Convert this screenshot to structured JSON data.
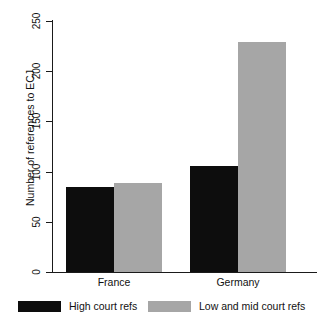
{
  "chart_data": {
    "type": "bar",
    "title": "",
    "xlabel": "",
    "ylabel": "Number of references to ECJ",
    "categories": [
      "France",
      "Germany"
    ],
    "series": [
      {
        "name": "High court refs",
        "color": "#0d0d0d",
        "values": [
          85,
          106
        ]
      },
      {
        "name": "Low and mid court refs",
        "color": "#a6a6a6",
        "values": [
          89,
          229
        ]
      }
    ],
    "ylim": [
      0,
      250
    ],
    "yticks": [
      0,
      50,
      100,
      150,
      200,
      250
    ],
    "ytick_labels": [
      "0",
      "50",
      "100",
      "150",
      "200",
      "250"
    ],
    "grid": false,
    "legend_position": "bottom"
  },
  "axis": {
    "y_title": "Number of references to ECJ",
    "ticks": [
      {
        "label": "250",
        "value": 250
      },
      {
        "label": "200",
        "value": 200
      },
      {
        "label": "150",
        "value": 150
      },
      {
        "label": "100",
        "value": 100
      },
      {
        "label": "50",
        "value": 50
      },
      {
        "label": "0",
        "value": 0
      }
    ]
  },
  "categories": [
    {
      "label": "France"
    },
    {
      "label": "Germany"
    }
  ],
  "legend": {
    "items": [
      {
        "label": "High court refs",
        "color": "#0d0d0d"
      },
      {
        "label": "Low and mid court refs",
        "color": "#a6a6a6"
      }
    ]
  }
}
